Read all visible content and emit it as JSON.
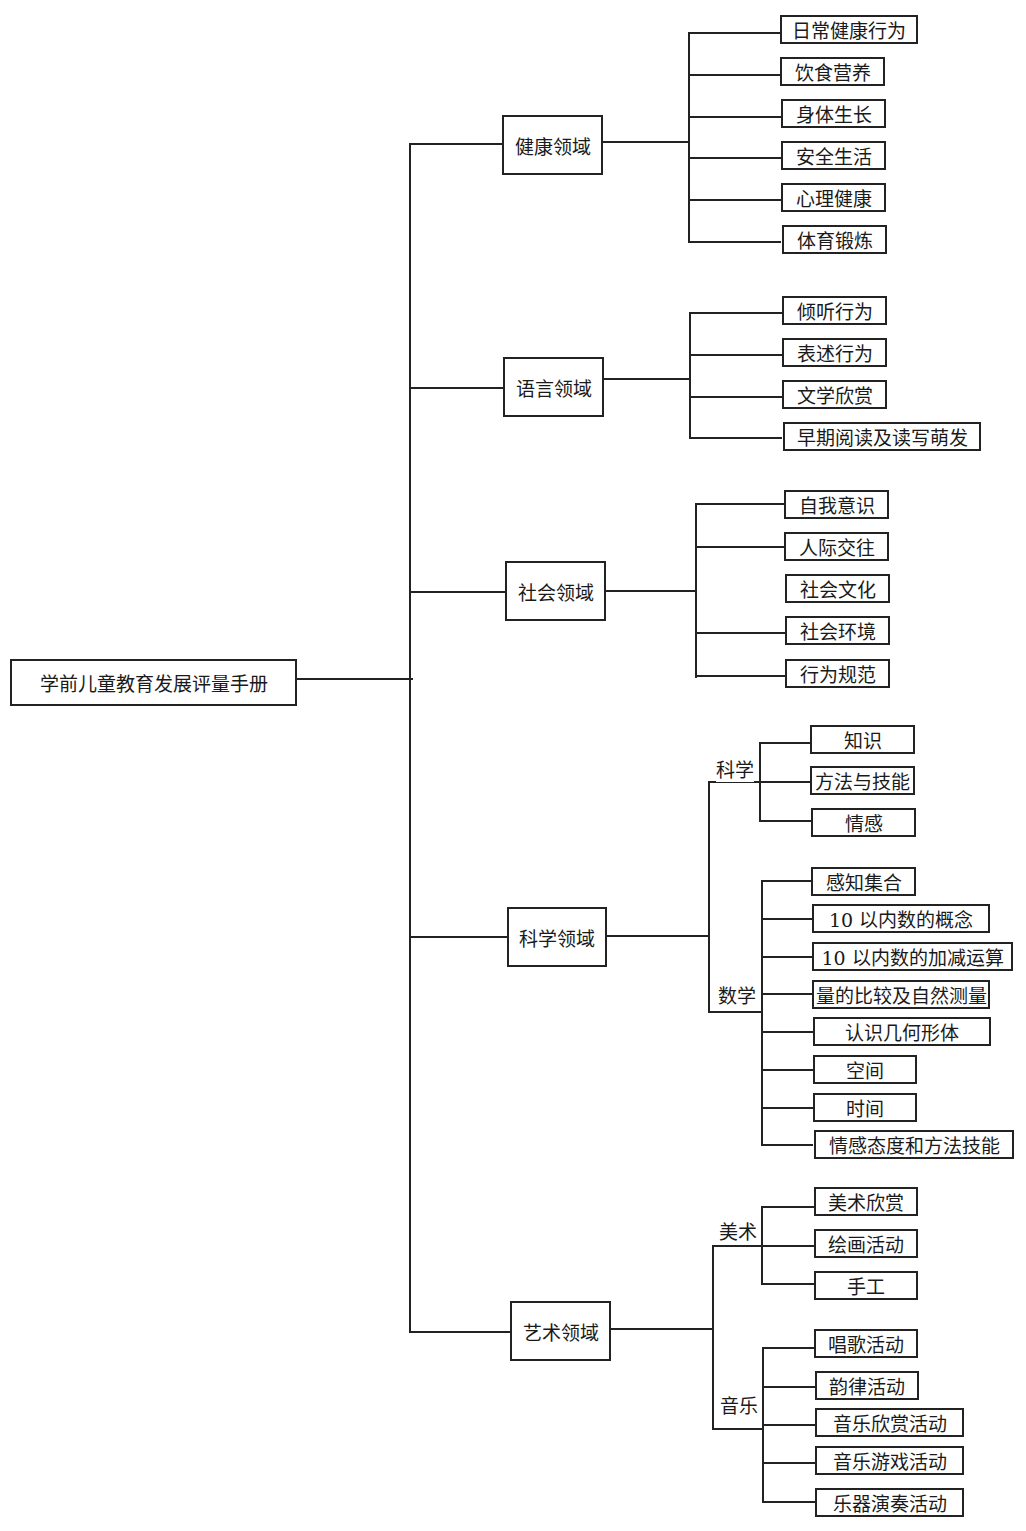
{
  "root": {
    "label": "学前儿童教育发展评量手册"
  },
  "domains": [
    {
      "label": "健康领域",
      "items": [
        "日常健康行为",
        "饮食营养",
        "身体生长",
        "安全生活",
        "心理健康",
        "体育锻炼"
      ]
    },
    {
      "label": "语言领域",
      "items": [
        "倾听行为",
        "表述行为",
        "文学欣赏",
        "早期阅读及读写萌发"
      ]
    },
    {
      "label": "社会领域",
      "items": [
        "自我意识",
        "人际交往",
        "社会文化",
        "社会环境",
        "行为规范"
      ]
    },
    {
      "label": "科学领域",
      "subgroups": [
        {
          "label": "科学",
          "items": [
            "知识",
            "方法与技能",
            "情感"
          ]
        },
        {
          "label": "数学",
          "items": [
            "感知集合",
            "10 以内数的概念",
            "10 以内数的加减运算",
            "量的比较及自然测量",
            "认识几何形体",
            "空间",
            "时间",
            "情感态度和方法技能"
          ]
        }
      ]
    },
    {
      "label": "艺术领域",
      "subgroups": [
        {
          "label": "美术",
          "items": [
            "美术欣赏",
            "绘画活动",
            "手工"
          ]
        },
        {
          "label": "音乐",
          "items": [
            "唱歌活动",
            "韵律活动",
            "音乐欣赏活动",
            "音乐游戏活动",
            "乐器演奏活动"
          ]
        }
      ]
    }
  ]
}
